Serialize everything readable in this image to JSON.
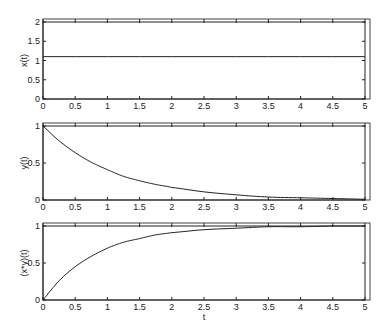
{
  "chart_data": [
    {
      "type": "line",
      "title": "",
      "xlabel": "",
      "ylabel": "x(t)",
      "xlim": [
        0,
        5
      ],
      "ylim": [
        0,
        2
      ],
      "xticks": [
        0,
        0.5,
        1,
        1.5,
        2,
        2.5,
        3,
        3.5,
        4,
        4.5,
        5
      ],
      "xtick_labels": [
        "0",
        "0.5",
        "1",
        "1.5",
        "2",
        "2.5",
        "3",
        "3.5",
        "4",
        "4.5",
        "5"
      ],
      "yticks": [
        0,
        0.5,
        1,
        1.5,
        2
      ],
      "ytick_labels": [
        "0",
        "0.5",
        "1",
        "1.5",
        "2"
      ],
      "grid": false,
      "series": [
        {
          "name": "x(t)",
          "x": [
            0,
            0.5,
            1,
            1.5,
            2,
            2.5,
            3,
            3.5,
            4,
            4.5,
            5
          ],
          "values": [
            1.1,
            1.1,
            1.1,
            1.1,
            1.1,
            1.1,
            1.1,
            1.1,
            1.1,
            1.1,
            1.1
          ]
        }
      ]
    },
    {
      "type": "line",
      "title": "",
      "xlabel": "",
      "ylabel": "y(t)",
      "xlim": [
        0,
        5
      ],
      "ylim": [
        0,
        1
      ],
      "xticks": [
        0,
        0.5,
        1,
        1.5,
        2,
        2.5,
        3,
        3.5,
        4,
        4.5,
        5
      ],
      "xtick_labels": [
        "0",
        "0.5",
        "1",
        "1.5",
        "2",
        "2.5",
        "3",
        "3.5",
        "4",
        "4.5",
        "5"
      ],
      "yticks": [
        0,
        0.5,
        1
      ],
      "ytick_labels": [
        "0",
        "0.5",
        "1"
      ],
      "grid": false,
      "series": [
        {
          "name": "y(t)",
          "x": [
            0,
            0.25,
            0.5,
            0.75,
            1,
            1.25,
            1.5,
            1.75,
            2,
            2.5,
            3,
            3.5,
            4,
            4.5,
            5
          ],
          "values": [
            1.0,
            0.8,
            0.64,
            0.51,
            0.41,
            0.32,
            0.26,
            0.21,
            0.17,
            0.11,
            0.07,
            0.04,
            0.03,
            0.02,
            0.01
          ]
        }
      ]
    },
    {
      "type": "line",
      "title": "",
      "xlabel": "t",
      "ylabel": "(x*y)(t)",
      "xlim": [
        0,
        5
      ],
      "ylim": [
        0,
        1
      ],
      "xticks": [
        0,
        0.5,
        1,
        1.5,
        2,
        2.5,
        3,
        3.5,
        4,
        4.5,
        5
      ],
      "xtick_labels": [
        "0",
        "0.5",
        "1",
        "1.5",
        "2",
        "2.5",
        "3",
        "3.5",
        "4",
        "4.5",
        "5"
      ],
      "yticks": [
        0,
        0.5,
        1
      ],
      "ytick_labels": [
        "0",
        "0.5",
        "1"
      ],
      "grid": false,
      "series": [
        {
          "name": "(x*y)(t)",
          "x": [
            0,
            0.25,
            0.5,
            0.75,
            1,
            1.25,
            1.5,
            1.75,
            2,
            2.5,
            3,
            3.5,
            4,
            4.5,
            5
          ],
          "values": [
            0.0,
            0.26,
            0.45,
            0.59,
            0.7,
            0.78,
            0.83,
            0.88,
            0.91,
            0.95,
            0.97,
            0.99,
            0.99,
            1.0,
            1.0
          ]
        }
      ]
    }
  ],
  "panels": [
    {
      "ylabel": "x(t)",
      "xlabel": ""
    },
    {
      "ylabel": "y(t)",
      "xlabel": ""
    },
    {
      "ylabel": "(x*y)(t)",
      "xlabel": "t"
    }
  ]
}
